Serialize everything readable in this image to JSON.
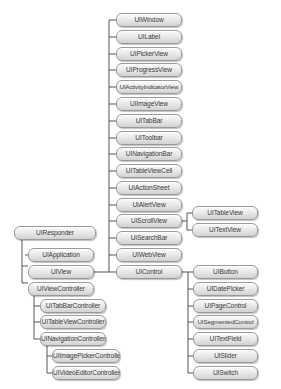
{
  "colors": {
    "line": "#555555",
    "node_border": "#9a9a9a",
    "node_text": "#3a3a3a"
  },
  "nodes": {
    "uiresponder": "UIResponder",
    "uiapplication": "UIApplication",
    "uiview": "UIView",
    "uiviewcontroller": "UIViewController",
    "uitabbarcontroller": "UITabBarController",
    "uitableviewcontroller": "UITableViewController",
    "uinavigationcontroller": "UINavigationController",
    "uiimagepickercontroller": "UIImagePickerController",
    "uivideoeditorcontroller": "UIVideoEditorController",
    "uiwindow": "UIWindow",
    "uilabel": "UILabel",
    "uipickerview": "UIPickerView",
    "uiprogressview": "UIProgressView",
    "uiactivityindicatorview": "UIActivityIndicatorView",
    "uiimageview": "UIImageView",
    "uitabbar": "UITabBar",
    "uitoolbar": "UIToolbar",
    "uinavigationbar": "UINavigationBar",
    "uitableviewcell": "UITableViewCell",
    "uiactionsheet": "UIActionSheet",
    "uialertview": "UIAlertView",
    "uiscrollview": "UIScrollView",
    "uisearchbar": "UISearchBar",
    "uiwebview": "UIWebView",
    "uicontrol": "UIControl",
    "uitableview": "UITableView",
    "uitextview": "UITextView",
    "uibutton": "UIButton",
    "uidatepicker": "UIDatePicker",
    "uipagecontrol": "UIPageControl",
    "uisegmentedcontrol": "UISegmentedControl",
    "uitextfield": "UITextField",
    "uislider": "UISlider",
    "uiswitch": "UISwitch"
  },
  "hierarchy": {
    "UIResponder": [
      "UIApplication",
      "UIView",
      "UIViewController"
    ],
    "UIView": [
      "UIWindow",
      "UILabel",
      "UIPickerView",
      "UIProgressView",
      "UIActivityIndicatorView",
      "UIImageView",
      "UITabBar",
      "UIToolbar",
      "UINavigationBar",
      "UITableViewCell",
      "UIActionSheet",
      "UIAlertView",
      "UIScrollView",
      "UISearchBar",
      "UIWebView",
      "UIControl"
    ],
    "UIScrollView": [
      "UITableView",
      "UITextView"
    ],
    "UIControl": [
      "UIButton",
      "UIDatePicker",
      "UIPageControl",
      "UISegmentedControl",
      "UITextField",
      "UISlider",
      "UISwitch"
    ],
    "UIViewController": [
      "UITabBarController",
      "UITableViewController",
      "UINavigationController"
    ],
    "UINavigationController": [
      "UIImagePickerController",
      "UIVideoEditorController"
    ]
  }
}
